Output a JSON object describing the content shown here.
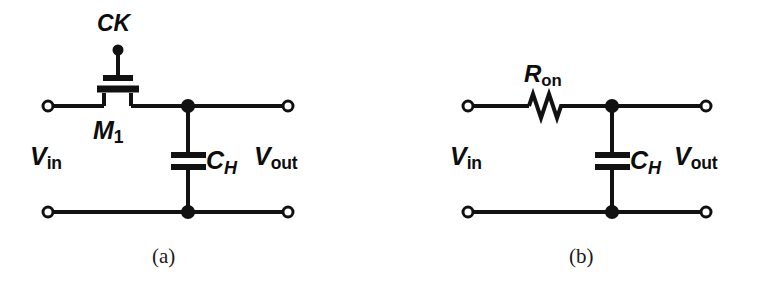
{
  "figure": {
    "kind": "circuit-schematic-pair",
    "background_color": "#ffffff",
    "ink_color": "#111111"
  },
  "panel_a": {
    "caption": "(a)",
    "clock_label": "CK",
    "device_label_main": "M",
    "device_label_sub": "1",
    "cap_label_main": "C",
    "cap_label_sub": "H",
    "input_label_main": "V",
    "input_label_sub": "in",
    "output_label_main": "V",
    "output_label_sub": "out",
    "components": [
      "nmos-switch-M1",
      "hold-capacitor-CH",
      "input-terminal",
      "output-terminal",
      "ground-rail"
    ]
  },
  "panel_b": {
    "caption": "(b)",
    "resistor_label_main": "R",
    "resistor_label_sub": "on",
    "cap_label_main": "C",
    "cap_label_sub": "H",
    "input_label_main": "V",
    "input_label_sub": "in",
    "output_label_main": "V",
    "output_label_sub": "out",
    "components": [
      "on-resistance-Ron",
      "hold-capacitor-CH",
      "input-terminal",
      "output-terminal",
      "ground-rail"
    ]
  }
}
